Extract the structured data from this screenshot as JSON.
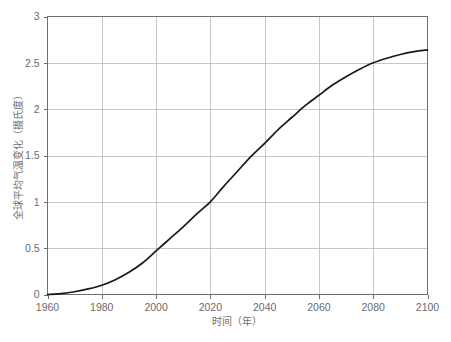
{
  "chart_data": {
    "type": "line",
    "title": "",
    "subtitle": "",
    "xlabel": "时间（年）",
    "ylabel": "全球平均气温变化（摄氏度）",
    "xlim": [
      1960,
      2100
    ],
    "ylim": [
      0,
      3
    ],
    "grid": true,
    "legend": false,
    "legend_position": "none",
    "xticks": [
      1960,
      1980,
      2000,
      2020,
      2040,
      2060,
      2080,
      2100
    ],
    "xtick_labels": [
      "1960",
      "1980",
      "2000",
      "2020",
      "2040",
      "2060",
      "2080",
      "2100"
    ],
    "yticks": [
      0,
      0.5,
      1,
      1.5,
      2,
      2.5,
      3
    ],
    "ytick_labels": [
      "0",
      "0.5",
      "1",
      "1.5",
      "2",
      "2.5",
      "3"
    ],
    "line_color": "#1a1a1a",
    "grid_color": "#b9b9b9",
    "frame_color": "#6e6e6e",
    "series": [
      {
        "name": "全球平均气温变化",
        "x": [
          1960,
          1965,
          1970,
          1975,
          1980,
          1985,
          1990,
          1995,
          2000,
          2005,
          2010,
          2015,
          2020,
          2025,
          2030,
          2035,
          2040,
          2045,
          2050,
          2055,
          2060,
          2065,
          2070,
          2075,
          2080,
          2085,
          2090,
          2095,
          2100
        ],
        "values": [
          0.0,
          0.01,
          0.03,
          0.06,
          0.1,
          0.16,
          0.24,
          0.34,
          0.47,
          0.6,
          0.73,
          0.87,
          1.0,
          1.17,
          1.33,
          1.49,
          1.63,
          1.78,
          1.91,
          2.04,
          2.15,
          2.26,
          2.35,
          2.43,
          2.5,
          2.55,
          2.59,
          2.62,
          2.64
        ]
      }
    ]
  },
  "axis": {
    "y_title": "全球平均气温变化（摄氏度）",
    "x_title": "时间（年）"
  }
}
